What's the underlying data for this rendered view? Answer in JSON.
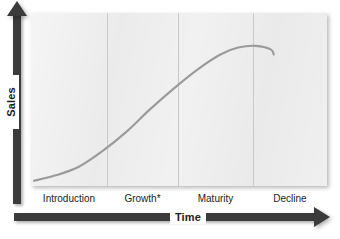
{
  "figure": {
    "axes": {
      "y_label": "Sales",
      "x_label": "Time",
      "y_arrow_icon": "arrow-up-icon",
      "x_arrow_icon": "arrow-right-icon"
    }
  },
  "chart_data": {
    "type": "line",
    "title": "",
    "xlabel": "Time",
    "ylabel": "Sales",
    "grid": false,
    "legend": "none",
    "categories": [
      "Introduction",
      "Growth*",
      "Maturity",
      "Decline"
    ],
    "stage_labels": [
      "Introduction",
      "Growth*",
      "Maturity",
      "Decline"
    ],
    "stage_boundaries_pct": [
      0,
      25.7,
      49.7,
      75.0,
      100
    ],
    "xlim": [
      0,
      100
    ],
    "ylim": [
      0,
      100
    ],
    "series": [
      {
        "name": "Sales",
        "color": "#9a9a9a",
        "x": [
          1,
          8,
          16,
          24,
          32,
          40,
          48,
          56,
          64,
          70,
          76,
          81,
          82
        ],
        "values": [
          3,
          6,
          11,
          20,
          31,
          44,
          56,
          67,
          76,
          80,
          81,
          79,
          76
        ]
      }
    ],
    "annotations": [
      {
        "text": "Growth*",
        "note": "asterisk present on Growth stage label"
      }
    ]
  },
  "colors": {
    "plot_background": "#e9e9e9",
    "axis": "#3b3b3b",
    "curve": "#9a9a9a",
    "divider": "#c9c9c9",
    "text": "#1c1c1c",
    "page_background": "#ffffff"
  }
}
